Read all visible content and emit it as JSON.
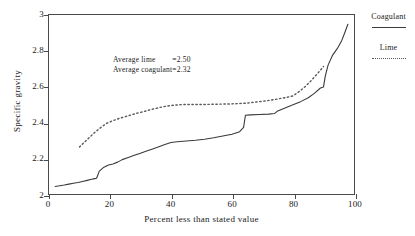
{
  "chart_data": {
    "type": "line",
    "title": "",
    "xlabel": "Percent less than stated value",
    "ylabel": "Specific gravity",
    "xlim": [
      0,
      100
    ],
    "ylim": [
      2,
      3
    ],
    "xticks": [
      "0",
      "20",
      "40",
      "60",
      "80",
      "100"
    ],
    "xtick_values": [
      0,
      20,
      40,
      60,
      80,
      100
    ],
    "yticks": [
      "2",
      "2.2",
      "2.4",
      "2.6",
      "2.8",
      "3"
    ],
    "ytick_values": [
      2,
      2.2,
      2.4,
      2.6,
      2.8,
      3
    ],
    "grid": false,
    "legend_position": "right-outside",
    "series": [
      {
        "name": "Coagulant",
        "style": "solid",
        "color": "#3a3a3a",
        "x": [
          2.0,
          3.5,
          5.0,
          6.5,
          8.0,
          9.5,
          11.0,
          12.5,
          14.0,
          15.0,
          15.6,
          16.5,
          18.0,
          19.5,
          21.0,
          22.5,
          24.0,
          26.0,
          28.0,
          30.0,
          32.0,
          34.0,
          36.0,
          38.0,
          40.0,
          42.0,
          45.0,
          48.0,
          51.0,
          54.0,
          57.0,
          60.0,
          62.5,
          63.8,
          64.4,
          66.0,
          69.0,
          72.0,
          74.0,
          74.8,
          77.0,
          80.0,
          82.5,
          85.0,
          87.0,
          89.0,
          90.0,
          90.6,
          91.5,
          93.0,
          94.5,
          96.0,
          97.0,
          98.0
        ],
        "y": [
          2.042,
          2.046,
          2.05,
          2.055,
          2.06,
          2.064,
          2.07,
          2.076,
          2.082,
          2.086,
          2.088,
          2.128,
          2.15,
          2.162,
          2.168,
          2.178,
          2.192,
          2.204,
          2.216,
          2.228,
          2.24,
          2.252,
          2.264,
          2.276,
          2.288,
          2.292,
          2.296,
          2.3,
          2.306,
          2.314,
          2.324,
          2.334,
          2.348,
          2.372,
          2.44,
          2.442,
          2.444,
          2.446,
          2.45,
          2.462,
          2.478,
          2.498,
          2.516,
          2.538,
          2.562,
          2.592,
          2.598,
          2.66,
          2.72,
          2.776,
          2.812,
          2.858,
          2.902,
          2.948
        ]
      },
      {
        "name": "Lime",
        "style": "dotted",
        "color": "#5a5a5a",
        "x": [
          10.0,
          11.5,
          13.0,
          14.5,
          16.0,
          17.5,
          19.0,
          21.0,
          23.0,
          25.0,
          27.0,
          29.0,
          31.0,
          33.0,
          35.0,
          37.0,
          39.0,
          41.0,
          44.0,
          47.0,
          50.0,
          53.0,
          56.0,
          59.0,
          62.0,
          65.0,
          68.0,
          71.0,
          74.0,
          76.0,
          78.0,
          80.0,
          82.0,
          84.0,
          86.0,
          88.0,
          90.0
        ],
        "y": [
          2.262,
          2.288,
          2.312,
          2.336,
          2.358,
          2.378,
          2.396,
          2.41,
          2.422,
          2.432,
          2.442,
          2.452,
          2.46,
          2.47,
          2.478,
          2.486,
          2.492,
          2.496,
          2.5,
          2.5,
          2.5,
          2.501,
          2.502,
          2.503,
          2.505,
          2.508,
          2.514,
          2.52,
          2.528,
          2.534,
          2.54,
          2.548,
          2.572,
          2.6,
          2.634,
          2.672,
          2.712
        ]
      }
    ],
    "annotations": [
      {
        "label": "Average lime",
        "eq": "=",
        "value": "2.50"
      },
      {
        "label": "Average coagulant",
        "eq": "=",
        "value": "2.32"
      }
    ]
  },
  "legend": {
    "entries": [
      {
        "label": "Coagulant",
        "style": "solid"
      },
      {
        "label": "Lime",
        "style": "dotted"
      }
    ]
  }
}
